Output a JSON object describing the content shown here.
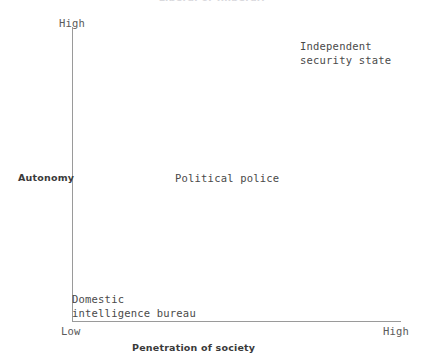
{
  "chart_data": {
    "type": "scatter",
    "title": "Liberal or Illiberal?",
    "xlabel": "Penetration of society",
    "ylabel": "Autonomy",
    "x_ticks": [
      "Low",
      "High"
    ],
    "y_ticks": [
      "Low",
      "High"
    ],
    "xlim": [
      "Low",
      "High"
    ],
    "ylim": [
      "Low",
      "High"
    ],
    "grid": false,
    "legend": "none",
    "annotations": [
      {
        "label": "Independent\nsecurity state",
        "x": "High",
        "y": "High"
      },
      {
        "label": "Political police",
        "x": "Medium",
        "y": "Medium"
      },
      {
        "label": "Domestic\nintelligence bureau",
        "x": "Low",
        "y": "Low"
      }
    ]
  },
  "axes": {
    "y": {
      "title": "Autonomy",
      "high_label": "High",
      "low_label": "Low"
    },
    "x": {
      "title": "Penetration of society",
      "high_label": "High",
      "low_label": "Low"
    }
  },
  "labels": {
    "independent_security_state": "Independent\nsecurity state",
    "political_police": "Political police",
    "domestic_intelligence_bureau": "Domestic\nintelligence bureau"
  },
  "colors": {
    "background": "#ffffff",
    "axis": "#9a9a9a",
    "text": "#4a4a4a",
    "axis_title": "#3a3a3a",
    "title_faded": "#d9d9dd"
  }
}
